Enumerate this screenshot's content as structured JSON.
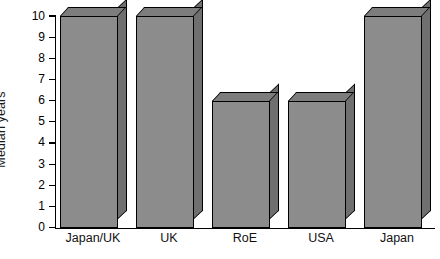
{
  "chart_data": {
    "type": "bar",
    "title": "",
    "subtitle": "",
    "xlabel": "",
    "ylabel": "Median years",
    "categories": [
      "Japan/UK",
      "UK",
      "RoE",
      "USA",
      "Japan"
    ],
    "values": [
      10,
      10,
      6,
      6,
      10
    ],
    "ylim": [
      0,
      10
    ],
    "ytick_labels": [
      "10",
      "9",
      "8",
      "7",
      "6",
      "5",
      "4",
      "3",
      "2",
      "1",
      "0"
    ],
    "ytick_values": [
      10,
      9,
      8,
      7,
      6,
      5,
      4,
      3,
      2,
      1,
      0
    ],
    "grid": false,
    "legend": null,
    "annotations": [],
    "style": {
      "bar_face_color": "#8c8c8c",
      "bar_top_color": "#7d7d7d",
      "bar_side_color": "#6f6f6f",
      "bar_edge_color": "#000000",
      "axis_color": "#000000",
      "background": "#ffffff",
      "three_d": true
    }
  }
}
